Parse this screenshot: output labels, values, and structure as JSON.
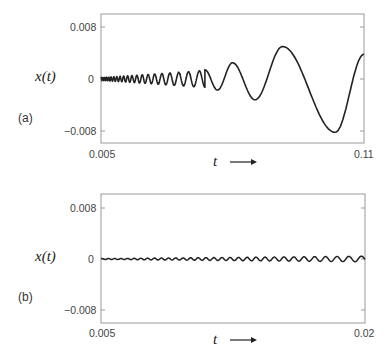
{
  "chart_data": [
    {
      "type": "line",
      "panel": "(a)",
      "title": "",
      "xlabel": "t",
      "ylabel": "x(t)",
      "xlim": [
        0.005,
        0.11
      ],
      "ylim": [
        -0.01,
        0.01
      ],
      "xticks": [
        "0.005",
        "0.11"
      ],
      "yticks": [
        "0.008",
        "0",
        "−0.008"
      ],
      "grid": false,
      "description": "Chirp-like oscillation: frequency decreases and amplitude grows with time",
      "x": [
        0.005,
        0.02,
        0.035,
        0.045,
        0.05,
        0.055,
        0.06,
        0.068,
        0.076,
        0.08,
        0.09,
        0.1,
        0.11
      ],
      "values": [
        0.0,
        0.0003,
        0.0008,
        0.0015,
        0.0014,
        -0.0017,
        0.0023,
        -0.0032,
        0.005,
        0.004,
        -0.005,
        -0.0083,
        0.0038
      ],
      "extrema": [
        {
          "t": 0.0465,
          "x": 0.0014
        },
        {
          "t": 0.0515,
          "x": -0.0017
        },
        {
          "t": 0.0575,
          "x": 0.0025
        },
        {
          "t": 0.0665,
          "x": -0.0032
        },
        {
          "t": 0.0775,
          "x": 0.005
        },
        {
          "t": 0.0985,
          "x": -0.0082
        },
        {
          "t": 0.11,
          "x": 0.0038
        }
      ]
    },
    {
      "type": "line",
      "panel": "(b)",
      "title": "",
      "xlabel": "t",
      "ylabel": "x(t)",
      "xlim": [
        0.005,
        0.02
      ],
      "ylim": [
        -0.01,
        0.01
      ],
      "xticks": [
        "0.005",
        "0.02"
      ],
      "yticks": [
        "0.008",
        "0",
        "−0.008"
      ],
      "grid": false,
      "description": "Small-amplitude oscillation around zero, slowly growing amplitude and decreasing frequency",
      "amplitude_range": [
        5e-05,
        0.0005
      ]
    }
  ],
  "panels": {
    "a": {
      "label": "(a)",
      "ylabel": "x(t)",
      "yticks": {
        "top": "0.008",
        "mid": "0",
        "bottom": "−0.008"
      },
      "xticks": {
        "left": "0.005",
        "right": "0.11"
      },
      "xlabel": "t"
    },
    "b": {
      "label": "(b)",
      "ylabel": "x(t)",
      "yticks": {
        "top": "0.008",
        "mid": "0",
        "bottom": "−0.008"
      },
      "xticks": {
        "left": "0.005",
        "right": "0.02"
      },
      "xlabel": "t"
    }
  },
  "colors": {
    "line": "#222222",
    "axes": "#999999",
    "text": "#444444"
  }
}
